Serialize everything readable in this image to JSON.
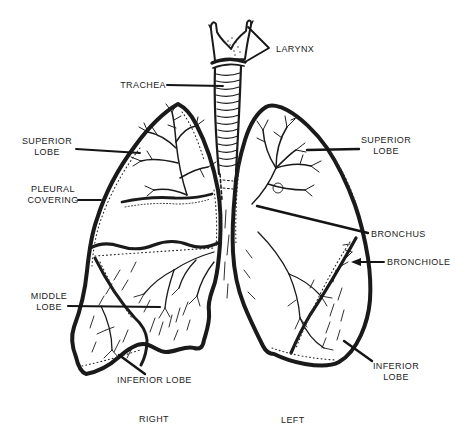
{
  "diagram": {
    "labels": {
      "larynx": "LARYNX",
      "trachea": "TRACHEA",
      "superior_lobe_right_lung": [
        "SUPERIOR",
        "LOBE"
      ],
      "pleural_covering": [
        "PLEURAL",
        "COVERING"
      ],
      "middle_lobe": [
        "MIDDLE",
        "LOBE"
      ],
      "inferior_lobe_right_lung": "INFERIOR LOBE",
      "superior_lobe_left_lung": [
        "SUPERIOR",
        "LOBE"
      ],
      "bronchus": "BRONCHUS",
      "bronchiole": "BRONCHIOLE",
      "inferior_lobe_left_lung": [
        "INFERIOR",
        "LOBE"
      ],
      "side_right": "RIGHT",
      "side_left": "LEFT"
    },
    "colors": {
      "ink": "#1a1a1a",
      "background": "#ffffff"
    }
  }
}
